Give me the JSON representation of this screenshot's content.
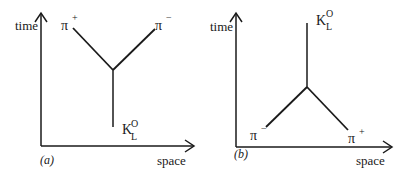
{
  "figure": {
    "panels": [
      {
        "tag": "(a)",
        "axis_y_label": "time",
        "axis_x_label": "space",
        "particles": [
          {
            "symbol": "π",
            "superscript": "+",
            "role": "outgoing upper-left"
          },
          {
            "symbol": "π",
            "superscript": "−",
            "role": "outgoing upper-right"
          },
          {
            "symbol": "K",
            "superscript": "O",
            "subscript": "L",
            "role": "incoming from below"
          }
        ]
      },
      {
        "tag": "(b)",
        "axis_y_label": "time",
        "axis_x_label": "space",
        "particles": [
          {
            "symbol": "K",
            "superscript": "O",
            "subscript": "L",
            "role": "outgoing upward"
          },
          {
            "symbol": "π",
            "superscript": "−",
            "role": "incoming lower-left"
          },
          {
            "symbol": "π",
            "superscript": "+",
            "role": "incoming lower-right"
          }
        ]
      }
    ],
    "colors": {
      "line": "#1a1a1a",
      "background": "#ffffff"
    }
  }
}
